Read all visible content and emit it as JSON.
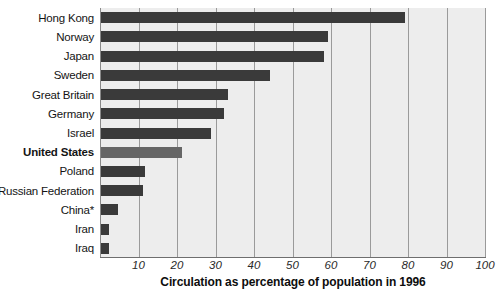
{
  "chart_data": {
    "type": "bar",
    "orientation": "horizontal",
    "title": "",
    "xlabel": "Circulation as percentage of population in 1996",
    "ylabel": "",
    "xlim": [
      0,
      100
    ],
    "xticks": [
      10,
      20,
      30,
      40,
      50,
      60,
      70,
      80,
      90,
      100
    ],
    "grid": true,
    "legend": "none",
    "highlight_category": "United States",
    "categories": [
      "Hong Kong",
      "Norway",
      "Japan",
      "Sweden",
      "Great Britain",
      "Germany",
      "Israel",
      "United States",
      "Poland",
      "Russian Federation",
      "China*",
      "Iran",
      "Iraq"
    ],
    "values": [
      79,
      59,
      58,
      44,
      33,
      32,
      28.5,
      21,
      11.5,
      10.8,
      4.3,
      2,
      2
    ],
    "footnote_marker": "*"
  },
  "colors": {
    "bar": "#3a3a3a",
    "bar_highlight": "#666666",
    "plot_background": "#ededed",
    "gridline": "#9a9a9a",
    "axis": "#6e6e6e",
    "text": "#141414",
    "page_background": "#ffffff"
  }
}
